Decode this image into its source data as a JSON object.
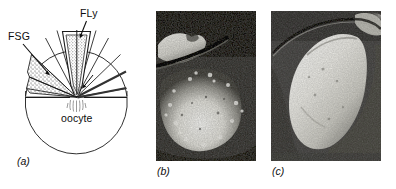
{
  "figure": {
    "caption_style": "italic-parenthetical",
    "background_color": "#ffffff",
    "ink_color": "#0d0d0d"
  },
  "panel_a": {
    "panel_label": "(a)",
    "type": "line-diagram",
    "labels": {
      "fsg": "FSG",
      "fly": "FLy",
      "oocyte": "oocyte"
    },
    "structures": [
      {
        "name": "follicle-sector-stippled",
        "label_ref": "FSG",
        "fill": "stipple"
      },
      {
        "name": "micropylar-canal",
        "label_ref": "FLy",
        "fill": "stipple"
      },
      {
        "name": "oocyte-body",
        "label_ref": "oocyte",
        "fill": "none"
      },
      {
        "name": "chorion-line",
        "label_ref": "",
        "fill": "none"
      }
    ],
    "leader_lines": [
      {
        "from": "FSG",
        "to": "follicle-sector-stippled"
      },
      {
        "from": "FLy",
        "to": "micropylar-canal"
      }
    ]
  },
  "panel_b": {
    "panel_label": "(b)",
    "type": "photomicrograph",
    "tone": "grayscale",
    "background_color": "#4a4a4a",
    "highlight_color": "#f2f2f0"
  },
  "panel_c": {
    "panel_label": "(c)",
    "type": "photomicrograph",
    "tone": "grayscale",
    "background_color": "#4f4f4f",
    "highlight_color": "#f0efe9"
  }
}
